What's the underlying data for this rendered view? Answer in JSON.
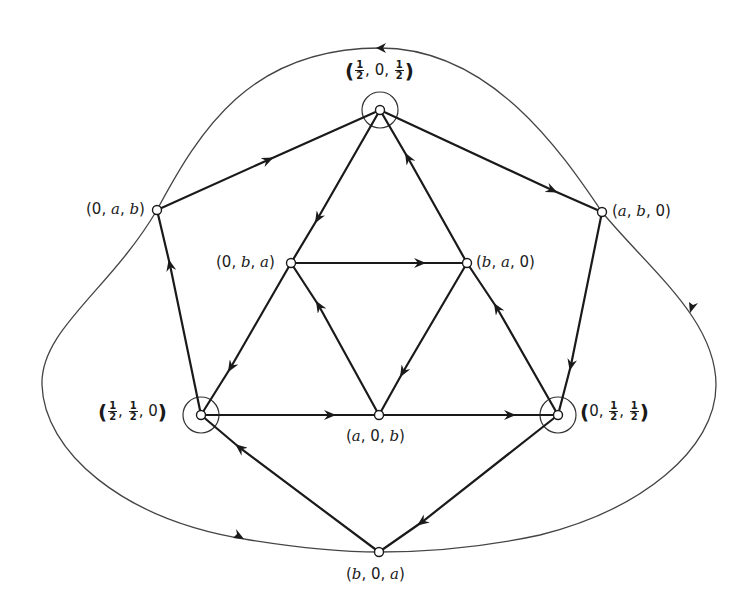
{
  "diagram": {
    "type": "directed-graph",
    "colors": {
      "edge": "#1a1a1a",
      "orbit": "#444444",
      "node_fill": "#ffffff"
    },
    "nodes": [
      {
        "id": "P",
        "label": "(1/2, 0, 1/2)",
        "x": 380,
        "y": 110,
        "circled": true
      },
      {
        "id": "L",
        "label": "(0, a, b)",
        "x": 157,
        "y": 210,
        "circled": false
      },
      {
        "id": "R",
        "label": "(a, b, 0)",
        "x": 602,
        "y": 212,
        "circled": false
      },
      {
        "id": "I1",
        "label": "(0, b, a)",
        "x": 291,
        "y": 263,
        "circled": false
      },
      {
        "id": "I2",
        "label": "(b, a, 0)",
        "x": 467,
        "y": 263,
        "circled": false
      },
      {
        "id": "BL",
        "label": "(1/2, 1/2, 0)",
        "x": 201,
        "y": 415,
        "circled": true
      },
      {
        "id": "I3",
        "label": "(a, 0, b)",
        "x": 379,
        "y": 415,
        "circled": false
      },
      {
        "id": "BR",
        "label": "(0, 1/2, 1/2)",
        "x": 558,
        "y": 415,
        "circled": true
      },
      {
        "id": "B",
        "label": "(b, 0, a)",
        "x": 379,
        "y": 552,
        "circled": false
      }
    ],
    "edges": [
      {
        "from": "L",
        "to": "P"
      },
      {
        "from": "P",
        "to": "R"
      },
      {
        "from": "R",
        "to": "BR"
      },
      {
        "from": "BR",
        "to": "B"
      },
      {
        "from": "B",
        "to": "BL"
      },
      {
        "from": "BL",
        "to": "L"
      },
      {
        "from": "P",
        "to": "I1"
      },
      {
        "from": "I1",
        "to": "BL"
      },
      {
        "from": "BR",
        "to": "I2"
      },
      {
        "from": "I2",
        "to": "P"
      },
      {
        "from": "BL",
        "to": "I3"
      },
      {
        "from": "I3",
        "to": "BR"
      },
      {
        "from": "I1",
        "to": "I2"
      },
      {
        "from": "I2",
        "to": "I3"
      },
      {
        "from": "I3",
        "to": "I1"
      }
    ],
    "outer_orbit": {
      "direction": "counterclockwise",
      "passes_through": [
        "L",
        "B",
        "R"
      ]
    }
  },
  "labels": {
    "P": {
      "open": "(",
      "f1": {
        "n": "1",
        "d": "2"
      },
      "mid": ", 0, ",
      "f2": {
        "n": "1",
        "d": "2"
      },
      "close": ")"
    },
    "BL": {
      "open": "(",
      "f1": {
        "n": "1",
        "d": "2"
      },
      "sep": ", ",
      "f2": {
        "n": "1",
        "d": "2"
      },
      "tail": ", 0",
      "close": ")"
    },
    "BR": {
      "open": "(",
      "head": "0, ",
      "f1": {
        "n": "1",
        "d": "2"
      },
      "sep": ", ",
      "f2": {
        "n": "1",
        "d": "2"
      },
      "close": ")"
    },
    "L": {
      "p1": "(0, ",
      "v1": "a",
      "p2": ", ",
      "v2": "b",
      "p3": ")"
    },
    "R": {
      "p1": "(",
      "v1": "a",
      "p2": ", ",
      "v2": "b",
      "p3": ", 0)"
    },
    "I1": {
      "p1": "(0, ",
      "v1": "b",
      "p2": ", ",
      "v2": "a",
      "p3": ")"
    },
    "I2": {
      "p1": "(",
      "v1": "b",
      "p2": ", ",
      "v2": "a",
      "p3": ", 0)"
    },
    "I3": {
      "p1": "(",
      "v1": "a",
      "p2": ", 0, ",
      "v2": "b",
      "p3": ")"
    },
    "B": {
      "p1": "(",
      "v1": "b",
      "p2": ", 0, ",
      "v2": "a",
      "p3": ")"
    }
  }
}
